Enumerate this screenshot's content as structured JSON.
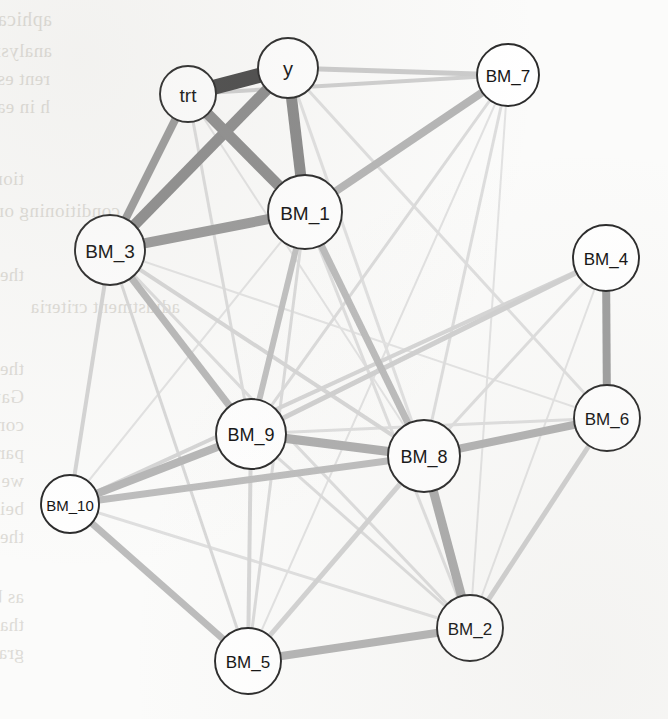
{
  "figure": {
    "kind": "network-graph",
    "background": "scanned book page with reversed text bleed-through"
  },
  "chart_data": {
    "type": "network",
    "title": "",
    "nodes": [
      {
        "id": "trt",
        "label": "trt",
        "x": 188,
        "y": 94,
        "r": 28,
        "font": 19
      },
      {
        "id": "y",
        "label": "y",
        "x": 288,
        "y": 68,
        "r": 30,
        "font": 20
      },
      {
        "id": "BM_7",
        "label": "BM_7",
        "x": 508,
        "y": 75,
        "r": 31,
        "font": 17
      },
      {
        "id": "BM_1",
        "label": "BM_1",
        "x": 305,
        "y": 212,
        "r": 37,
        "font": 19
      },
      {
        "id": "BM_3",
        "label": "BM_3",
        "x": 110,
        "y": 250,
        "r": 35,
        "font": 19
      },
      {
        "id": "BM_4",
        "label": "BM_4",
        "x": 606,
        "y": 258,
        "r": 33,
        "font": 17
      },
      {
        "id": "BM_6",
        "label": "BM_6",
        "x": 607,
        "y": 418,
        "r": 33,
        "font": 17
      },
      {
        "id": "BM_9",
        "label": "BM_9",
        "x": 251,
        "y": 434,
        "r": 35,
        "font": 18
      },
      {
        "id": "BM_8",
        "label": "BM_8",
        "x": 424,
        "y": 456,
        "r": 36,
        "font": 18
      },
      {
        "id": "BM_10",
        "label": "BM_10",
        "x": 70,
        "y": 504,
        "r": 29,
        "font": 15
      },
      {
        "id": "BM_2",
        "label": "BM_2",
        "x": 470,
        "y": 628,
        "r": 33,
        "font": 17
      },
      {
        "id": "BM_5",
        "label": "BM_5",
        "x": 248,
        "y": 661,
        "r": 33,
        "font": 17
      }
    ],
    "edges": [
      {
        "source": "trt",
        "target": "y",
        "weight": 1.0,
        "width": 15,
        "color": "#4a4a4a"
      },
      {
        "source": "trt",
        "target": "BM_1",
        "weight": 0.62,
        "width": 11,
        "color": "#8e8e8e"
      },
      {
        "source": "trt",
        "target": "BM_3",
        "weight": 0.45,
        "width": 8,
        "color": "#9b9b9b"
      },
      {
        "source": "trt",
        "target": "BM_7",
        "weight": 0.12,
        "width": 4,
        "color": "#cfcfcf"
      },
      {
        "source": "trt",
        "target": "BM_9",
        "weight": 0.07,
        "width": 3,
        "color": "#dcdcdc"
      },
      {
        "source": "trt",
        "target": "BM_8",
        "weight": 0.05,
        "width": 2,
        "color": "#e2e2e2"
      },
      {
        "source": "y",
        "target": "BM_1",
        "weight": 0.6,
        "width": 11,
        "color": "#8a8a8a"
      },
      {
        "source": "y",
        "target": "BM_3",
        "weight": 0.58,
        "width": 11,
        "color": "#8d8d8d"
      },
      {
        "source": "y",
        "target": "BM_7",
        "weight": 0.14,
        "width": 5,
        "color": "#cbcbcb"
      },
      {
        "source": "y",
        "target": "BM_6",
        "weight": 0.06,
        "width": 3,
        "color": "#dedede"
      },
      {
        "source": "y",
        "target": "BM_8",
        "weight": 0.05,
        "width": 3,
        "color": "#e0e0e0"
      },
      {
        "source": "BM_1",
        "target": "BM_3",
        "weight": 0.5,
        "width": 10,
        "color": "#9a9a9a"
      },
      {
        "source": "BM_1",
        "target": "BM_7",
        "weight": 0.3,
        "width": 8,
        "color": "#b5b5b5"
      },
      {
        "source": "BM_1",
        "target": "BM_9",
        "weight": 0.22,
        "width": 6,
        "color": "#c0c0c0"
      },
      {
        "source": "BM_1",
        "target": "BM_8",
        "weight": 0.24,
        "width": 7,
        "color": "#bbbbbb"
      },
      {
        "source": "BM_1",
        "target": "BM_5",
        "weight": 0.08,
        "width": 3,
        "color": "#dadada"
      },
      {
        "source": "BM_1",
        "target": "BM_2",
        "weight": 0.06,
        "width": 3,
        "color": "#dedede"
      },
      {
        "source": "BM_1",
        "target": "BM_10",
        "weight": 0.05,
        "width": 2,
        "color": "#e2e2e2"
      },
      {
        "source": "BM_3",
        "target": "BM_9",
        "weight": 0.26,
        "width": 7,
        "color": "#b8b8b8"
      },
      {
        "source": "BM_3",
        "target": "BM_10",
        "weight": 0.11,
        "width": 4,
        "color": "#d4d4d4"
      },
      {
        "source": "BM_3",
        "target": "BM_5",
        "weight": 0.09,
        "width": 3,
        "color": "#d8d8d8"
      },
      {
        "source": "BM_3",
        "target": "BM_8",
        "weight": 0.1,
        "width": 4,
        "color": "#d6d6d6"
      },
      {
        "source": "BM_3",
        "target": "BM_2",
        "weight": 0.07,
        "width": 3,
        "color": "#dcdcdc"
      },
      {
        "source": "BM_3",
        "target": "BM_6",
        "weight": 0.05,
        "width": 2,
        "color": "#e3e3e3"
      },
      {
        "source": "BM_7",
        "target": "BM_9",
        "weight": 0.07,
        "width": 3,
        "color": "#dbdbdb"
      },
      {
        "source": "BM_7",
        "target": "BM_8",
        "weight": 0.06,
        "width": 3,
        "color": "#dddddd"
      },
      {
        "source": "BM_7",
        "target": "BM_5",
        "weight": 0.05,
        "width": 2,
        "color": "#e1e1e1"
      },
      {
        "source": "BM_7",
        "target": "BM_2",
        "weight": 0.05,
        "width": 2,
        "color": "#e2e2e2"
      },
      {
        "source": "BM_4",
        "target": "BM_6",
        "weight": 0.42,
        "width": 8,
        "color": "#9e9e9e"
      },
      {
        "source": "BM_4",
        "target": "BM_9",
        "weight": 0.12,
        "width": 5,
        "color": "#d0d0d0"
      },
      {
        "source": "BM_4",
        "target": "BM_10",
        "weight": 0.1,
        "width": 4,
        "color": "#d5d5d5"
      },
      {
        "source": "BM_4",
        "target": "BM_8",
        "weight": 0.06,
        "width": 3,
        "color": "#dddddd"
      },
      {
        "source": "BM_4",
        "target": "BM_2",
        "weight": 0.05,
        "width": 2,
        "color": "#e2e2e2"
      },
      {
        "source": "BM_6",
        "target": "BM_8",
        "weight": 0.3,
        "width": 8,
        "color": "#b2b2b2"
      },
      {
        "source": "BM_6",
        "target": "BM_2",
        "weight": 0.13,
        "width": 5,
        "color": "#cfcfcf"
      },
      {
        "source": "BM_6",
        "target": "BM_9",
        "weight": 0.06,
        "width": 3,
        "color": "#dedede"
      },
      {
        "source": "BM_9",
        "target": "BM_8",
        "weight": 0.34,
        "width": 9,
        "color": "#aeaeae"
      },
      {
        "source": "BM_9",
        "target": "BM_10",
        "weight": 0.28,
        "width": 8,
        "color": "#b6b6b6"
      },
      {
        "source": "BM_9",
        "target": "BM_5",
        "weight": 0.1,
        "width": 4,
        "color": "#d6d6d6"
      },
      {
        "source": "BM_9",
        "target": "BM_2",
        "weight": 0.07,
        "width": 3,
        "color": "#dbdbdb"
      },
      {
        "source": "BM_8",
        "target": "BM_10",
        "weight": 0.24,
        "width": 7,
        "color": "#bdbdbd"
      },
      {
        "source": "BM_8",
        "target": "BM_2",
        "weight": 0.36,
        "width": 9,
        "color": "#ababab"
      },
      {
        "source": "BM_8",
        "target": "BM_5",
        "weight": 0.12,
        "width": 5,
        "color": "#d2d2d2"
      },
      {
        "source": "BM_10",
        "target": "BM_5",
        "weight": 0.26,
        "width": 7,
        "color": "#bcbcbc"
      },
      {
        "source": "BM_10",
        "target": "BM_2",
        "weight": 0.06,
        "width": 3,
        "color": "#dfdfdf"
      },
      {
        "source": "BM_5",
        "target": "BM_2",
        "weight": 0.3,
        "width": 8,
        "color": "#b4b4b4"
      }
    ],
    "node_style": {
      "fill": "#ffffff",
      "stroke": "#2b2b2b",
      "stroke_width": 1.9
    },
    "edge_color_range": {
      "strongest": "#4a4a4a",
      "weakest": "#e3e3e3"
    },
    "legend": null,
    "xlabel": "",
    "ylabel": ""
  },
  "bleed_text": {
    "lines": [
      {
        "t": "aphical Models for Backdoor Graphs",
        "x": 52,
        "y": 8,
        "s": 20
      },
      {
        "t": "analysis identifies components and",
        "x": 52,
        "y": 40,
        "s": 19
      },
      {
        "t": "rent estimate the average outcome",
        "x": 50,
        "y": 68,
        "s": 19
      },
      {
        "t": "h in each subgroup, the graph shows",
        "x": 50,
        "y": 96,
        "s": 19
      },
      {
        "t": "tions, pointing at all the neighbors of",
        "x": 24,
        "y": 168,
        "s": 19
      },
      {
        "t": "conditioning on the set",
        "x": 120,
        "y": 200,
        "s": 19
      },
      {
        "t": "the graph, an expert may be willing to assert",
        "x": 24,
        "y": 264,
        "s": 19
      },
      {
        "t": "adjustment criteria",
        "x": 180,
        "y": 296,
        "s": 19
      },
      {
        "t": "the model parameters. For such a chart, a",
        "x": 24,
        "y": 358,
        "s": 19
      },
      {
        "t": "Gaussian copula model with latent variables",
        "x": 24,
        "y": 386,
        "s": 19
      },
      {
        "t": "construct a sparse graph from the weights",
        "x": 24,
        "y": 414,
        "s": 19
      },
      {
        "t": "parameters, and the null hypothesis of zero",
        "x": 24,
        "y": 442,
        "s": 19
      },
      {
        "t": "we can allow the entries in the adjacency",
        "x": 24,
        "y": 470,
        "s": 19
      },
      {
        "t": "being clustered by Pearson correlation also",
        "x": 24,
        "y": 498,
        "s": 19
      },
      {
        "t": "the model should be selected by",
        "x": 24,
        "y": 526,
        "s": 19
      },
      {
        "t": "as before, the same idea applies, so return to",
        "x": 24,
        "y": 586,
        "s": 19
      },
      {
        "t": "that is another key step in the model diagnos",
        "x": 24,
        "y": 614,
        "s": 19
      },
      {
        "t": "graph, a collection of prior probabilities of each",
        "x": 24,
        "y": 642,
        "s": 19
      }
    ]
  }
}
